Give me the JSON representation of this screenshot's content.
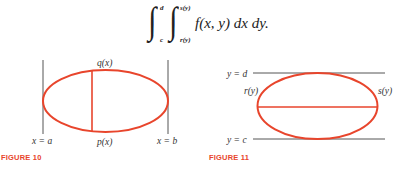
{
  "formula": {
    "outer_integral": {
      "lower": "c",
      "upper": "d"
    },
    "inner_integral": {
      "lower": "r(y)",
      "upper": "s(y)"
    },
    "integrand": "f(x, y) dx dy."
  },
  "colors": {
    "curve": "#e8452c",
    "lines": "#555555",
    "caption": "#e8452c"
  },
  "figures": [
    {
      "caption": "FIGURE 10",
      "labels": {
        "top": "q(x)",
        "bottom": "p(x)",
        "left_bound": "x = a",
        "right_bound": "x = b"
      }
    },
    {
      "caption": "FIGURE 11",
      "labels": {
        "upper_bound": "y = d",
        "lower_bound": "y = c",
        "left": "r(y)",
        "right": "s(y)"
      }
    }
  ]
}
